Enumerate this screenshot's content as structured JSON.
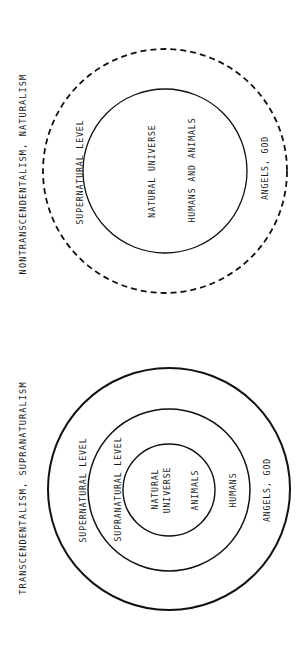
{
  "colors": {
    "background": "#ffffff",
    "ink": "#111111"
  },
  "diagrams": [
    {
      "id": "naturalism",
      "title": "NONTRANSCENDENTALISM, NATURALISM",
      "rings": [
        {
          "name": "supernatural-level",
          "style": "dashed",
          "label": "SUPERNATURAL LEVEL",
          "inner_label": "ANGELS, GOD"
        },
        {
          "name": "natural-universe",
          "style": "solid",
          "label": "NATURAL UNIVERSE",
          "inner_label": "HUMANS AND ANIMALS"
        }
      ]
    },
    {
      "id": "supranaturalism",
      "title": "TRANSCENDENTALISM, SUPRANATURALISM",
      "rings": [
        {
          "name": "supernatural-level",
          "style": "solid",
          "label": "SUPERNATURAL LEVEL",
          "inner_label": "ANGELS, GOD"
        },
        {
          "name": "supranatural-level",
          "style": "solid",
          "label": "SUPRANATURAL LEVEL",
          "inner_label": "HUMANS"
        },
        {
          "name": "natural-universe",
          "style": "solid",
          "label_line1": "NATURAL",
          "label_line2": "UNIVERSE",
          "inner_label": "ANIMALS"
        }
      ]
    }
  ]
}
